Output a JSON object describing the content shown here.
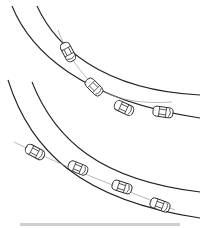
{
  "figure": {
    "panels": [
      {
        "name": "top-scenario",
        "description": "cars following within curved lane",
        "cars": 4
      },
      {
        "name": "bottom-scenario",
        "description": "lead car crossing inner lane line on curve",
        "cars": 4
      }
    ],
    "caption": "",
    "caption_note": "Caption is cropped at the bottom edge and unreadable at this resolution."
  },
  "colors": {
    "line": "#222222",
    "trajectory": "#999999",
    "background": "#ffffff"
  }
}
